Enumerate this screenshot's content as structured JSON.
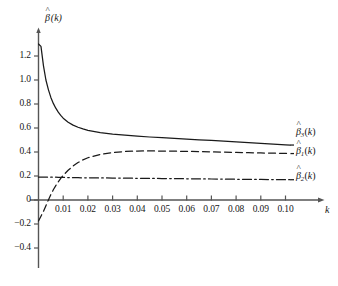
{
  "figure": {
    "background_color": "#ffffff",
    "line_color": "#1a1a1a",
    "axis_color": "#555555"
  },
  "axes": {
    "y_axis_label": "β̂(k)",
    "x_axis_label": "k",
    "y_ticks": [
      "1.2",
      "1.0",
      "0.8",
      "0.6",
      "0.4",
      "0.2",
      "0",
      "-0.2",
      "-0.4"
    ],
    "y_tick_values": [
      1.2,
      1.0,
      0.8,
      0.6,
      0.4,
      0.2,
      0,
      -0.2,
      -0.4
    ],
    "x_ticks": [
      "0.01",
      "0.02",
      "0.03",
      "0.04",
      "0.05",
      "0.06",
      "0.07",
      "0.08",
      "0.09",
      "0.10"
    ],
    "x_tick_values": [
      0.01,
      0.02,
      0.03,
      0.04,
      0.05,
      0.06,
      0.07,
      0.08,
      0.09,
      0.1
    ]
  },
  "curve_labels": {
    "beta3": "β̂₃(k)",
    "beta1": "β̂₁(k)",
    "beta2": "β̂₂(k)"
  },
  "chart_data": {
    "type": "line",
    "title": "",
    "xlabel": "k",
    "ylabel": "β̂(k)",
    "xlim": [
      0.0,
      0.108
    ],
    "ylim": [
      -0.45,
      1.32
    ],
    "grid": false,
    "legend_position": "right-inline",
    "x_ticks": [
      0.01,
      0.02,
      0.03,
      0.04,
      0.05,
      0.06,
      0.07,
      0.08,
      0.09,
      0.1
    ],
    "y_ticks": [
      1.2,
      1.0,
      0.8,
      0.6,
      0.4,
      0.2,
      0,
      -0.2,
      -0.4
    ],
    "x": [
      0.0,
      0.001,
      0.002,
      0.003,
      0.004,
      0.005,
      0.006,
      0.007,
      0.008,
      0.009,
      0.01,
      0.012,
      0.014,
      0.016,
      0.018,
      0.02,
      0.025,
      0.03,
      0.035,
      0.04,
      0.045,
      0.05,
      0.055,
      0.06,
      0.065,
      0.07,
      0.075,
      0.08,
      0.085,
      0.09,
      0.095,
      0.1,
      0.102
    ],
    "series": [
      {
        "name": "β̂₃(k)",
        "label": "beta3",
        "style": "solid",
        "values": [
          1.3,
          1.28,
          1.12,
          1.0,
          0.92,
          0.855,
          0.805,
          0.765,
          0.732,
          0.705,
          0.682,
          0.648,
          0.624,
          0.606,
          0.592,
          0.581,
          0.562,
          0.549,
          0.54,
          0.532,
          0.525,
          0.519,
          0.513,
          0.507,
          0.501,
          0.496,
          0.49,
          0.484,
          0.478,
          0.472,
          0.466,
          0.46,
          0.458
        ]
      },
      {
        "name": "β̂₁(k)",
        "label": "beta1",
        "style": "dashed",
        "values": [
          -0.175,
          -0.135,
          -0.095,
          -0.048,
          0.0,
          0.045,
          0.085,
          0.12,
          0.152,
          0.18,
          0.205,
          0.248,
          0.283,
          0.312,
          0.335,
          0.352,
          0.38,
          0.396,
          0.404,
          0.408,
          0.409,
          0.408,
          0.407,
          0.405,
          0.403,
          0.401,
          0.399,
          0.397,
          0.394,
          0.392,
          0.39,
          0.388,
          0.387
        ]
      },
      {
        "name": "β̂₂(k)",
        "label": "beta2",
        "style": "dashdot",
        "values": [
          0.19,
          0.19,
          0.19,
          0.19,
          0.19,
          0.19,
          0.19,
          0.19,
          0.189,
          0.189,
          0.188,
          0.187,
          0.186,
          0.186,
          0.185,
          0.185,
          0.184,
          0.183,
          0.182,
          0.181,
          0.18,
          0.179,
          0.178,
          0.177,
          0.176,
          0.175,
          0.174,
          0.173,
          0.172,
          0.171,
          0.17,
          0.169,
          0.169
        ]
      }
    ]
  }
}
